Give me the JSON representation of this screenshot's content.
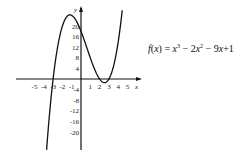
{
  "chart_data": {
    "type": "line",
    "title": "",
    "function_label": "f(x) = x³ − 2x² − 9x + 18",
    "equation": {
      "lhs": "f(x) = ",
      "terms": [
        "x",
        "3",
        " − 2x",
        "2",
        " − 9x + 18"
      ]
    },
    "xlabel": "x",
    "ylabel": "y",
    "x_ticks": [
      -5,
      -4,
      -3,
      -2,
      -1,
      1,
      2,
      3,
      4,
      5
    ],
    "y_ticks": [
      20,
      16,
      12,
      8,
      4,
      -4,
      -8,
      -12,
      -16,
      -20
    ],
    "x_tick_labels": [
      "-5",
      "-4",
      "-3",
      "-2",
      "-1",
      "1",
      "2",
      "3",
      "4",
      "5"
    ],
    "y_tick_labels": [
      "20",
      "16",
      "12",
      "8",
      "4",
      "-4",
      "-8",
      "-12",
      "-16",
      "-20"
    ],
    "xlim": [
      -6.9,
      6
    ],
    "ylim": [
      -27,
      26
    ],
    "grid": false,
    "legend": "none",
    "series": [
      {
        "name": "f(x) = x^3 - 2x^2 - 9x + 18",
        "coefficients": [
          1,
          -2,
          -9,
          18
        ],
        "x_range": [
          -3.7,
          4.6
        ],
        "points": [
          {
            "x": -3.5,
            "y": -17.9
          },
          {
            "x": -3,
            "y": 0
          },
          {
            "x": -2,
            "y": 20
          },
          {
            "x": -1.19,
            "y": 24.2
          },
          {
            "x": 0,
            "y": 18
          },
          {
            "x": 1,
            "y": 8
          },
          {
            "x": 2,
            "y": 0
          },
          {
            "x": 2.52,
            "y": -1.4
          },
          {
            "x": 3,
            "y": 0
          },
          {
            "x": 4,
            "y": 14
          },
          {
            "x": 4.5,
            "y": 28.1
          }
        ],
        "roots": [
          -3,
          2,
          3
        ],
        "local_max": {
          "x": -1.19,
          "y": 24.2
        },
        "local_min": {
          "x": 2.52,
          "y": -1.4
        }
      }
    ]
  }
}
